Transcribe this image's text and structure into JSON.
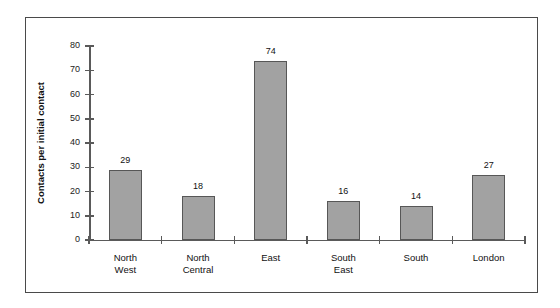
{
  "chart_data": {
    "type": "bar",
    "title": "",
    "subtitle": "",
    "xlabel": "",
    "ylabel": "Contacts per initial contact",
    "categories": [
      "North\nWest",
      "North\nCentral",
      "East",
      "South\nEast",
      "South",
      "London"
    ],
    "category_labels_flat": [
      "North West",
      "North Central",
      "East",
      "South East",
      "South",
      "London"
    ],
    "values": [
      29,
      18,
      74,
      16,
      14,
      27
    ],
    "data_labels": [
      "29",
      "18",
      "74",
      "16",
      "14",
      "27"
    ],
    "ylim": [
      0,
      80
    ],
    "ytick_values": [
      0,
      10,
      20,
      30,
      40,
      50,
      60,
      70,
      80
    ],
    "ytick_labels": [
      "0",
      "10",
      "20",
      "30",
      "40",
      "50",
      "60",
      "70",
      "80"
    ],
    "grid": false,
    "legend": null,
    "legend_position": "none",
    "bar_fill_color": "#a2a2a2",
    "bar_border_color": "#575757",
    "axis_color": "#5a5a5a",
    "frame_border_color": "#4a4a4a",
    "background_color": "#ffffff",
    "text_color": "#111111"
  }
}
